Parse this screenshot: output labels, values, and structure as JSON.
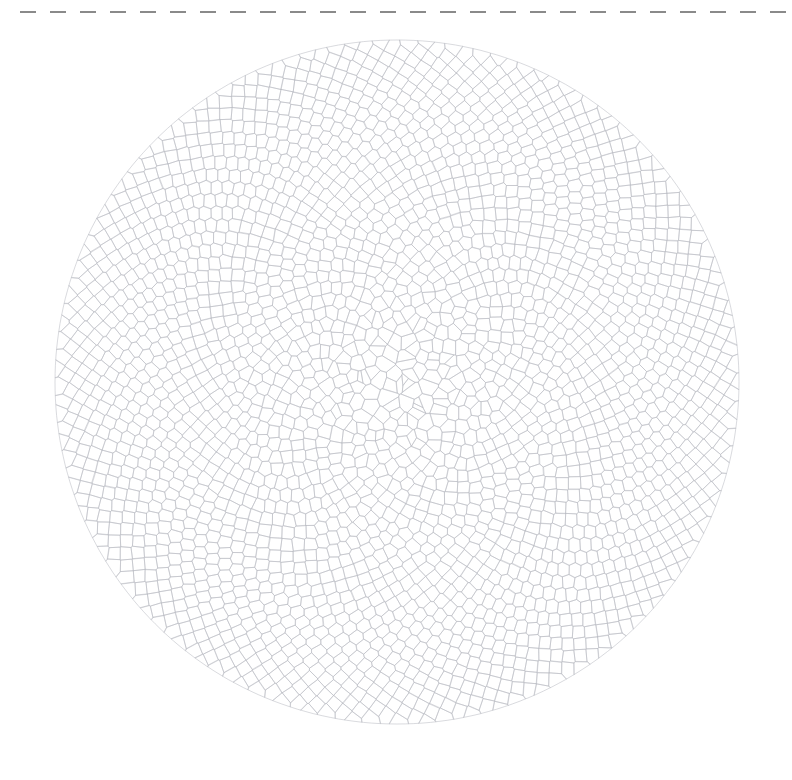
{
  "canvas": {
    "width": 792,
    "height": 780,
    "background_color": "#ffffff"
  },
  "top_rule": {
    "label": "dashed-separator",
    "color": "#8a8a8a",
    "y": 12,
    "x_start": 20,
    "x_end": 786,
    "thickness": 2,
    "dash_length": 16,
    "gap_length": 14
  },
  "figure": {
    "type": "voronoi-phyllotaxis",
    "center_x": 397,
    "center_y": 382,
    "radius": 342,
    "point_count": 2600,
    "divergence_angle_deg": 137.507764,
    "radial_exponent": 0.5,
    "stroke_color": "#b9bcc2",
    "stroke_width": 0.55,
    "fill_color": "none",
    "jitter": 0.22,
    "core_scale": 0.0,
    "seed": 20240917
  },
  "chart_data": {
    "type": "scatter",
    "subtitle": "",
    "xlabel": "",
    "ylabel": "",
    "grid": false,
    "legend": null,
    "annotations": [],
    "xlim": [
      55,
      739
    ],
    "ylim": [
      40,
      724
    ],
    "generator": {
      "model": "Vogel spiral (sunflower phyllotaxis)",
      "formula_angle": "theta_n = n * 137.507764 deg",
      "formula_radius": "r_n = R * sqrt(n / N)",
      "N": 2600,
      "R": 342,
      "tessellation": "Voronoi cells clipped to disc"
    },
    "visible_features": [
      "dense small cells at center forming a tight spiral",
      "cells elongate radially toward the rim",
      "interference spiral arm families (parastichies) visible",
      "uniform pale gray outlines, white fill"
    ]
  }
}
